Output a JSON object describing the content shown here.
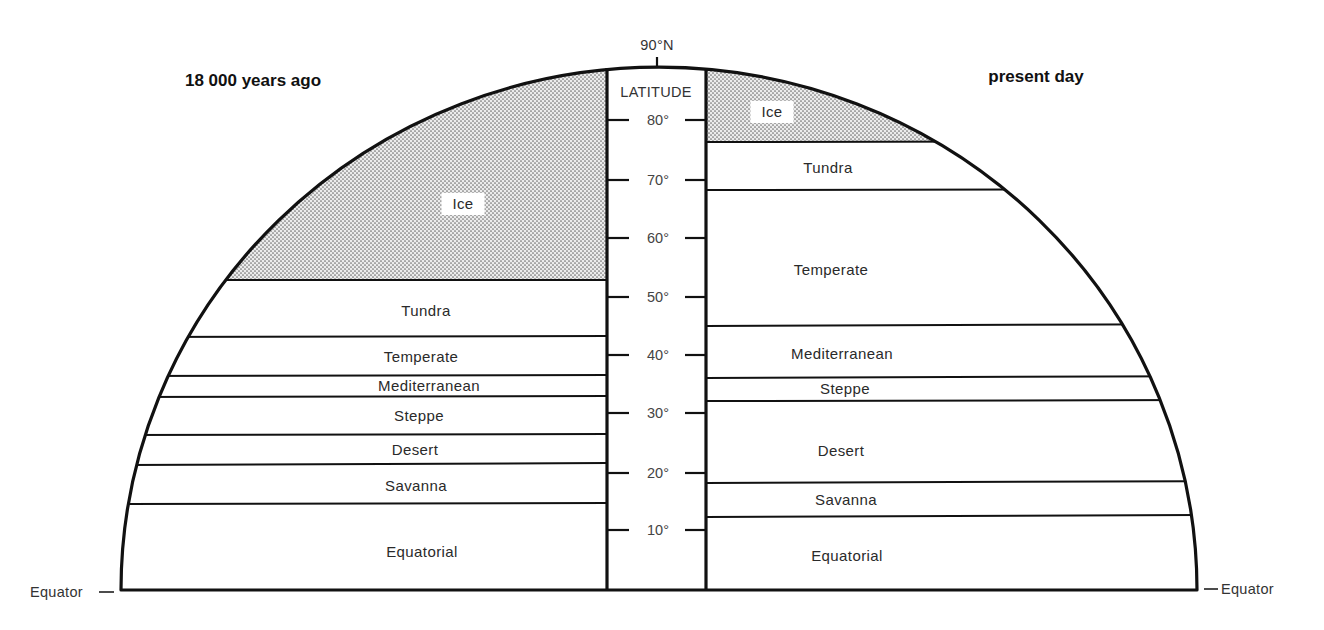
{
  "title_left": "18 000 years ago",
  "title_right": "present day",
  "pole_label": "90°N",
  "axis_title": "LATITUDE",
  "equator_label_left": "Equator",
  "equator_label_right": "Equator",
  "ticks": [
    {
      "label": "80°",
      "lat": 80,
      "y": 120
    },
    {
      "label": "70°",
      "lat": 70,
      "y": 180
    },
    {
      "label": "60°",
      "lat": 60,
      "y": 238
    },
    {
      "label": "50°",
      "lat": 50,
      "y": 297
    },
    {
      "label": "40°",
      "lat": 40,
      "y": 355
    },
    {
      "label": "30°",
      "lat": 30,
      "y": 413
    },
    {
      "label": "20°",
      "lat": 20,
      "y": 473
    },
    {
      "label": "10°",
      "lat": 10,
      "y": 530
    }
  ],
  "colors": {
    "ice_fill": "#d6d6d6",
    "ice_dot": "#6f6f6f",
    "line": "#111111",
    "background": "#ffffff"
  },
  "left_zones": [
    {
      "name": "Ice",
      "top": 67,
      "bottom": 280,
      "label_y": 209,
      "label_x": 463,
      "shaded": true
    },
    {
      "name": "Tundra",
      "top": 280,
      "bottom": 337,
      "label_y": 316,
      "label_x": 426
    },
    {
      "name": "Temperate",
      "top": 337,
      "bottom": 376,
      "label_y": 362,
      "label_x": 421
    },
    {
      "name": "Mediterranean",
      "top": 376,
      "bottom": 397,
      "label_y": 391,
      "label_x": 429
    },
    {
      "name": "Steppe",
      "top": 397,
      "bottom": 435,
      "label_y": 421,
      "label_x": 419
    },
    {
      "name": "Desert",
      "top": 435,
      "bottom": 464,
      "label_y": 455,
      "label_x": 415
    },
    {
      "name": "Savanna",
      "top": 464,
      "bottom": 504,
      "label_y": 491,
      "label_x": 416
    },
    {
      "name": "Equatorial",
      "top": 504,
      "bottom": 590,
      "label_y": 557,
      "label_x": 422
    }
  ],
  "right_zones": [
    {
      "name": "Ice",
      "top": 67,
      "bottom": 142,
      "label_y": 117,
      "label_x": 772,
      "shaded": true
    },
    {
      "name": "Tundra",
      "top": 142,
      "bottom": 190,
      "label_y": 173,
      "label_x": 828
    },
    {
      "name": "Temperate",
      "top": 190,
      "bottom": 325,
      "label_y": 275,
      "label_x": 831
    },
    {
      "name": "Mediterranean",
      "top": 325,
      "bottom": 377,
      "label_y": 359,
      "label_x": 842
    },
    {
      "name": "Steppe",
      "top": 377,
      "bottom": 401,
      "label_y": 394,
      "label_x": 845
    },
    {
      "name": "Desert",
      "top": 401,
      "bottom": 482,
      "label_y": 456,
      "label_x": 841
    },
    {
      "name": "Savanna",
      "top": 482,
      "bottom": 516,
      "label_y": 505,
      "label_x": 846
    },
    {
      "name": "Equatorial",
      "top": 516,
      "bottom": 590,
      "label_y": 561,
      "label_x": 847
    }
  ]
}
